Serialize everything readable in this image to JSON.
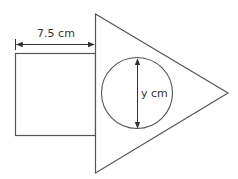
{
  "diagram": {
    "labels": {
      "square_width": "7.5 cm",
      "circle_diameter": "y cm"
    },
    "colors": {
      "stroke": "#555555",
      "text": "#333333",
      "background": "#ffffff"
    }
  }
}
